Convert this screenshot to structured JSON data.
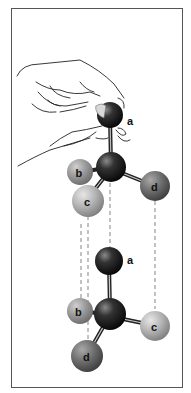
{
  "figure": {
    "colors": {
      "frame": "#555555",
      "background": "#ffffff",
      "central_atom": "#1a1a1a",
      "atom_a": "#2a2a2a",
      "atom_b": "#9a9a9a",
      "atom_c": "#b8b8b8",
      "atom_d": "#6e6e6e",
      "dashed_line": "#666666",
      "hand_outline": "#222222"
    },
    "top_molecule": {
      "labels": {
        "a": "a",
        "b": "b",
        "c": "c",
        "d": "d"
      }
    },
    "bottom_molecule": {
      "labels": {
        "a": "a",
        "b": "b",
        "c": "c",
        "d": "d"
      }
    }
  }
}
